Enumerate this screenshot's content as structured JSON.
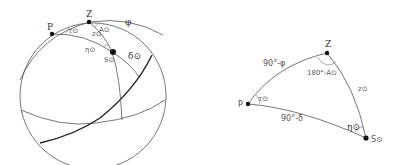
{
  "sphere": {
    "labels": {
      "P": "P",
      "Z": "Z",
      "phi": "φ",
      "tau": "τ⊙",
      "A": "A⊙",
      "z": "z⊙",
      "eta": "η⊙",
      "S": "S⊙",
      "delta": "δ⊙"
    }
  },
  "triangle": {
    "labels": {
      "Z": "Z",
      "P": "P",
      "S": "S⊙",
      "side_PZ": "90°-φ",
      "angle_Z": "180°-A⊙",
      "side_ZS": "z⊙",
      "angle_P": "τ⊙",
      "side_PS": "90°-δ",
      "angle_S": "η⊙"
    }
  }
}
